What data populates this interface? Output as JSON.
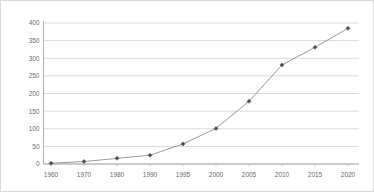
{
  "chart_data": {
    "type": "line",
    "title": "",
    "xlabel": "",
    "ylabel": "",
    "categories": [
      "1960",
      "1970",
      "1980",
      "1990",
      "1995",
      "2000",
      "2005",
      "2010",
      "2015",
      "2020"
    ],
    "x": [
      1960,
      1970,
      1980,
      1990,
      1995,
      2000,
      2005,
      2010,
      2015,
      2020
    ],
    "values": [
      2,
      7,
      16,
      25,
      57,
      101,
      178,
      281,
      331,
      385
    ],
    "series": [
      {
        "name": "",
        "values": [
          2,
          7,
          16,
          25,
          57,
          101,
          178,
          281,
          331,
          385
        ]
      }
    ],
    "ylim": [
      0,
      400
    ],
    "yticks": [
      0,
      50,
      100,
      150,
      200,
      250,
      300,
      350,
      400
    ],
    "ytick_labels": [
      "0",
      "50",
      "100",
      "150",
      "200",
      "250",
      "300",
      "350",
      "400"
    ],
    "xtick_labels": [
      "1960",
      "1970",
      "1980",
      "1990",
      "1995",
      "2000",
      "2005",
      "2010",
      "2015",
      "2020"
    ],
    "grid": true,
    "legend": "none",
    "marker": "diamond",
    "line_color": "#8f8f8f",
    "marker_color": "#4a4a4a",
    "grid_color": "#c9c9c9",
    "axis_color": "#9a9a9a",
    "background": "#ffffff",
    "border_color": "#d8d8d8"
  }
}
